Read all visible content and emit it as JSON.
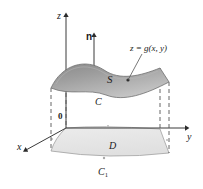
{
  "figure": {
    "labels": {
      "z_axis": "z",
      "x_axis": "x",
      "y_axis": "y",
      "origin": "0",
      "normal_vector": "n",
      "surface": "S",
      "boundary_curve": "C",
      "region": "D",
      "region_boundary_base": "C",
      "region_boundary_sub": "1",
      "surface_equation_lhs": "z",
      "surface_equation_eq": "=",
      "surface_equation_rhs": "g(x, y)"
    },
    "colors": {
      "background": "#ffffff",
      "stroke": "#4d4d4d",
      "axis": "#3a3a3a",
      "dashed": "#555555",
      "surface_dark": "#8e8e8e",
      "surface_mid": "#a8a8a8",
      "surface_light": "#c9c9c9",
      "surface_edge": "#6a6a6a",
      "region_fill": "#e6e6e6",
      "region_edge": "#9a9a9a",
      "text": "#1a1a1a"
    }
  }
}
